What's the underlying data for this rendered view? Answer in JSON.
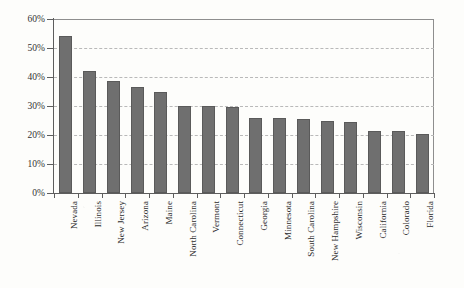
{
  "chart_data": {
    "type": "bar",
    "title": "",
    "xlabel": "",
    "ylabel": "",
    "ylim": [
      0,
      60
    ],
    "ytick_labels": [
      "0%",
      "10%",
      "20%",
      "30%",
      "40%",
      "50%",
      "60%"
    ],
    "ytick_values": [
      0,
      10,
      20,
      30,
      40,
      50,
      60
    ],
    "grid": true,
    "grid_style": "dashed-horizontal",
    "legend": "none",
    "value_unit": "percent",
    "bar_color": "#6f6f6f",
    "axis_color": "#5d5d5d",
    "gridline_color": "#b9b9b9",
    "plot_background": "#fdfdfb",
    "categories": [
      "Nevada",
      "Illinois",
      "New Jersey",
      "Arizona",
      "Maine",
      "North Carolina",
      "Vermont",
      "Connecticut",
      "Georgia",
      "Minnesota",
      "South Carolina",
      "New Hampshire",
      "Wisconsin",
      "California",
      "Colorado",
      "Florida"
    ],
    "values": [
      54,
      42,
      38.5,
      36.5,
      35,
      30,
      30,
      29.5,
      26,
      26,
      25.5,
      25,
      24.5,
      21.5,
      21.5,
      20.5
    ]
  }
}
